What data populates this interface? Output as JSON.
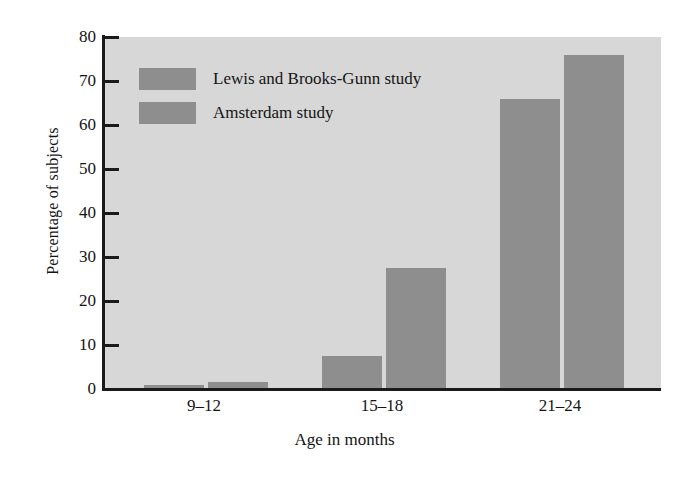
{
  "chart_data": {
    "type": "bar",
    "title": "",
    "subtitle": "",
    "xlabel": "Age in months",
    "ylabel": "Percentage of subjects",
    "categories": [
      "9–12",
      "15–18",
      "21–24"
    ],
    "series": [
      {
        "name": "Lewis and Brooks-Gunn study",
        "values": [
          1,
          7.5,
          66
        ],
        "color": "#8e8e8e"
      },
      {
        "name": "Amsterdam study",
        "values": [
          1.5,
          27.5,
          76
        ],
        "color": "#8e8e8e"
      }
    ],
    "ylim": [
      0,
      80
    ],
    "yticks": [
      0,
      10,
      20,
      30,
      40,
      50,
      60,
      70,
      80
    ],
    "ytick_labels": [
      "0",
      "10",
      "20",
      "30",
      "40",
      "50",
      "60",
      "70",
      "80"
    ],
    "grid": false,
    "legend_position": "upper-left-inside",
    "plot_background": "#d7d7d7",
    "figure_background": "#ffffff",
    "axis_color": "#1a1a1a",
    "text_color": "#141414"
  },
  "axes": {
    "y_title": "Percentage of subjects",
    "x_title": "Age in months",
    "y_ticks": [
      {
        "value": 80,
        "label": "80"
      },
      {
        "value": 70,
        "label": "70"
      },
      {
        "value": 60,
        "label": "60"
      },
      {
        "value": 50,
        "label": "50"
      },
      {
        "value": 40,
        "label": "40"
      },
      {
        "value": 30,
        "label": "30"
      },
      {
        "value": 20,
        "label": "20"
      },
      {
        "value": 10,
        "label": "10"
      },
      {
        "value": 0,
        "label": "0"
      }
    ],
    "x_categories": [
      {
        "label": "9–12"
      },
      {
        "label": "15–18"
      },
      {
        "label": "21–24"
      }
    ]
  },
  "legend": {
    "items": [
      {
        "label": "Lewis and Brooks-Gunn study",
        "color": "#8e8e8e"
      },
      {
        "label": "Amsterdam study",
        "color": "#8e8e8e"
      }
    ]
  }
}
